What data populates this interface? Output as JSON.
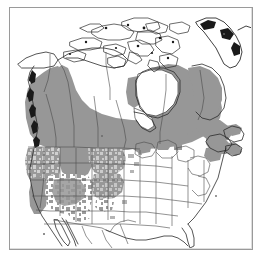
{
  "figure": {
    "kind": "distribution-range-map",
    "region": "North America",
    "caption": "",
    "background_color": "#ffffff",
    "frame_color": "#9a9a9a",
    "range_fill_color": "#979797",
    "range_fill_color_light": "#b4b4b4",
    "boundary_line_color": "#4a4a4a",
    "coast_line_color": "#2b2b2b",
    "dark_detail_color": "#1a1a1a",
    "unshaded_fill_color": "#ffffff"
  },
  "legend": {
    "shaded_meaning": "shaded range",
    "unshaded_meaning": "outside range",
    "visible": false
  },
  "map_layers": {
    "coastline": "North American coastline including Arctic Archipelago, Hudson Bay, Great Lakes, Gulf of Mexico, Baja California and west Greenland",
    "political_boundaries": "Canadian provincial and territorial borders, United States state borders, Canada-US border, US-Mexico border",
    "shading": "Solid gray across most of Canada; mottled gray patches across the western United States mountain ranges"
  },
  "shaded_areas": [
    {
      "name": "British Columbia",
      "coverage": "full"
    },
    {
      "name": "Alberta",
      "coverage": "full"
    },
    {
      "name": "Saskatchewan",
      "coverage": "full"
    },
    {
      "name": "Manitoba",
      "coverage": "full"
    },
    {
      "name": "Ontario",
      "coverage": "most"
    },
    {
      "name": "Quebec",
      "coverage": "most"
    },
    {
      "name": "Labrador",
      "coverage": "most"
    },
    {
      "name": "Yukon",
      "coverage": "southern"
    },
    {
      "name": "Northwest Territories",
      "coverage": "southern"
    },
    {
      "name": "New Brunswick",
      "coverage": "full"
    },
    {
      "name": "Nova Scotia",
      "coverage": "partial"
    },
    {
      "name": "Newfoundland",
      "coverage": "partial"
    },
    {
      "name": "Washington",
      "coverage": "most"
    },
    {
      "name": "Oregon",
      "coverage": "most"
    },
    {
      "name": "Idaho",
      "coverage": "most"
    },
    {
      "name": "Montana",
      "coverage": "western"
    },
    {
      "name": "Wyoming",
      "coverage": "patchy"
    },
    {
      "name": "Nevada",
      "coverage": "patchy"
    },
    {
      "name": "Utah",
      "coverage": "patchy"
    },
    {
      "name": "Colorado",
      "coverage": "patchy"
    },
    {
      "name": "California",
      "coverage": "northern and Sierra Nevada"
    },
    {
      "name": "Arizona",
      "coverage": "northern patches"
    },
    {
      "name": "New Mexico",
      "coverage": "northern patches"
    },
    {
      "name": "Maine",
      "coverage": "partial"
    },
    {
      "name": "Minnesota",
      "coverage": "northern patches"
    }
  ],
  "unshaded_areas": [
    "Nunavut / Arctic Archipelago",
    "Greenland",
    "Great Plains",
    "Midwest",
    "Southeast United States",
    "Texas",
    "Florida",
    "Mexico",
    "Baja California"
  ]
}
